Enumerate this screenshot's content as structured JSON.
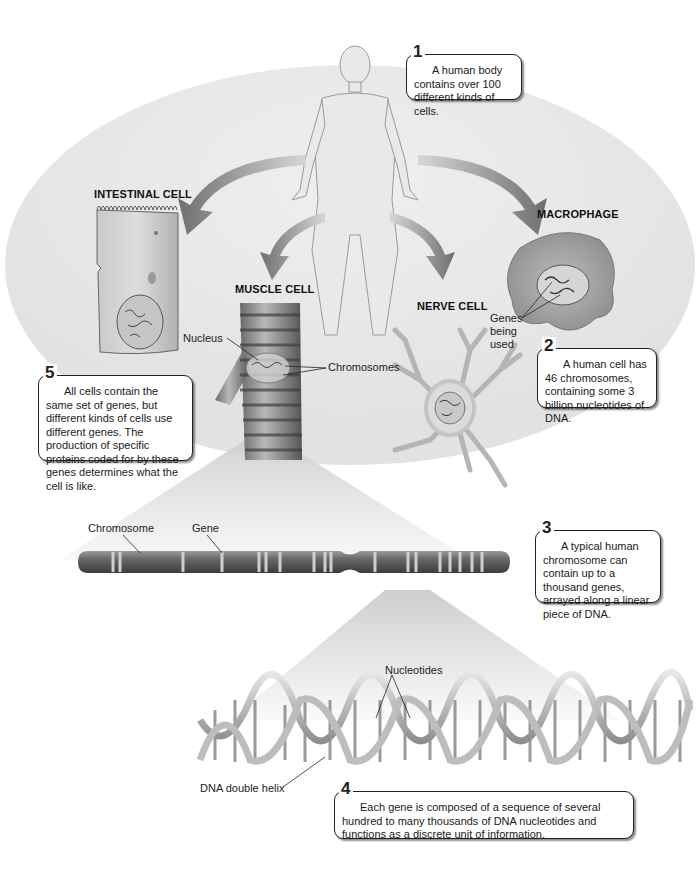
{
  "figure": {
    "cells": {
      "intestinal": {
        "title": "INTESTINAL CELL"
      },
      "muscle": {
        "title": "MUSCLE CELL"
      },
      "nerve": {
        "title": "NERVE CELL"
      },
      "macrophage": {
        "title": "MACROPHAGE"
      }
    },
    "labels": {
      "nucleus": "Nucleus",
      "chromosomes": "Chromosomes",
      "genes_being_used_1": "Genes",
      "genes_being_used_2": "being",
      "genes_being_used_3": "used",
      "chromosome": "Chromosome",
      "gene": "Gene",
      "nucleotides": "Nucleotides",
      "dna_double_helix": "DNA double helix"
    },
    "callouts": [
      {
        "num": "1",
        "text": "A human body contains over 100 different kinds of cells."
      },
      {
        "num": "2",
        "text": "A human cell has 46 chromosomes, containing some 3 billion nucleotides of DNA."
      },
      {
        "num": "3",
        "text": "A typical human chromosome can contain up to a thousand genes, arrayed along a linear piece of DNA."
      },
      {
        "num": "4",
        "text": "Each gene is composed of a sequence of several hundred to many thousands of DNA nucleotides and functions as a discrete unit of information."
      },
      {
        "num": "5",
        "text": "All cells contain the same set of genes, but different kinds of cells use different genes. The production of specific proteins coded for by these genes determines what the cell is like."
      }
    ],
    "colors": {
      "background_disc": "#e8e8e8",
      "arrow": "#8a8a8a",
      "chromosome": "#6e6e6e",
      "outline": "#222222"
    }
  }
}
